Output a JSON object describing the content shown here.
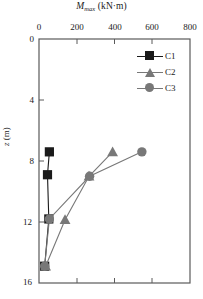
{
  "chart_data": {
    "type": "line",
    "title_parts": {
      "symbol": "M",
      "subscript": "max",
      "unit": "(kN·m)"
    },
    "xlabel": "Mmax (kN·m)",
    "ylabel": "z (m)",
    "ylabel_parts": {
      "symbol": "z",
      "unit": "(m)"
    },
    "xlim": [
      0,
      800
    ],
    "ylim": [
      0,
      16
    ],
    "y_inverted": true,
    "xticks": [
      0,
      200,
      400,
      600,
      800
    ],
    "yticks": [
      0,
      4,
      8,
      12,
      16
    ],
    "grid": false,
    "legend_position": "top-right",
    "series": [
      {
        "name": "C1",
        "color": "#1a1a1a",
        "marker": "square",
        "x": [
          55,
          45,
          52,
          30
        ],
        "y": [
          7.4,
          8.9,
          11.8,
          14.9
        ]
      },
      {
        "name": "C2",
        "color": "#787878",
        "marker": "triangle",
        "x": [
          390,
          265,
          138,
          35
        ],
        "y": [
          7.4,
          9.0,
          11.85,
          14.9
        ]
      },
      {
        "name": "C3",
        "color": "#787878",
        "marker": "circle",
        "x": [
          545,
          268,
          55,
          30
        ],
        "y": [
          7.4,
          9.0,
          11.8,
          14.9
        ]
      }
    ]
  },
  "axes": {
    "frame_color": "#5a5a5a",
    "tick_color": "#5a5a5a"
  },
  "legend": {
    "entries": [
      {
        "label": "C1",
        "marker": "square",
        "color": "#1a1a1a"
      },
      {
        "label": "C2",
        "marker": "triangle",
        "color": "#787878"
      },
      {
        "label": "C3",
        "marker": "circle",
        "color": "#787878"
      }
    ]
  },
  "xtick_labels": [
    "0",
    "200",
    "400",
    "600",
    "800"
  ],
  "ytick_labels": [
    "0",
    "4",
    "8",
    "12",
    "16"
  ]
}
